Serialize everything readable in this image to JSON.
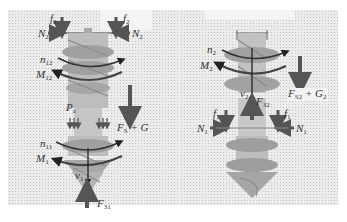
{
  "figure": {
    "panels": [
      {
        "id": "left",
        "description": "Screw pile with upper bearing and lower conical tip, combined loads",
        "labels": {
          "f2_left": "f",
          "f2_left_sub": "2",
          "f2_right": "f",
          "f2_right_sub": "2",
          "N2_left": "N",
          "N2_left_sub": "2",
          "N2_right": "N",
          "N2_right_sub": "2",
          "n12": "n",
          "n12_sub": "12",
          "M12": "M",
          "M12_sub": "12",
          "Pa": "P",
          "Pa_sub": "a",
          "FsG": "F",
          "FsG_sub": "S",
          "FsG_rest": " + G",
          "n11": "n",
          "n11_sub": "11",
          "M1": "M",
          "M1_sub": "1",
          "v1": "v",
          "v1_sub": "1",
          "F31": "F",
          "F31_sub": "31"
        }
      },
      {
        "id": "right",
        "description": "Screw pile with top cap, helical flights and conical tip",
        "labels": {
          "n2": "n",
          "n2_sub": "2",
          "M2": "M",
          "M2_sub": "2",
          "v2": "v",
          "v2_sub": "2",
          "F32": "F",
          "F32_sub": "32",
          "FS2G2": "F",
          "FS2G2_sub": "S2",
          "FS2G2_mid": " + G",
          "FS2G2_sub2": "2",
          "f1_left": "f",
          "f1_left_sub": "1",
          "f1_right": "f",
          "f1_right_sub": "1",
          "N1_left": "N",
          "N1_left_sub": "1",
          "N1_right": "N",
          "N1_right_sub": "1"
        }
      }
    ],
    "colors": {
      "background_stipple": "#ececec",
      "pile_body": "#b8b8b8",
      "flight": "#9a9a9a",
      "arrow": "#555555",
      "rotation_arc": "#333333"
    }
  }
}
